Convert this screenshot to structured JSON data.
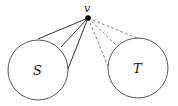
{
  "diagram": {
    "vertex": {
      "label": "v",
      "x": 88,
      "y": 18
    },
    "sets": [
      {
        "label": "S",
        "cx": 38,
        "cy": 70,
        "r": 30
      },
      {
        "label": "T",
        "cx": 138,
        "cy": 68,
        "r": 30
      }
    ],
    "solid_edges_to_S": [
      [
        38,
        39
      ],
      [
        61,
        47
      ],
      [
        68,
        69
      ]
    ],
    "dashed_edges_to_T": [
      [
        108,
        66
      ],
      [
        116,
        45
      ],
      [
        137,
        38
      ]
    ],
    "colors": {
      "stroke": "#333333",
      "dashed": "#777777",
      "vertex": "#000000"
    }
  }
}
